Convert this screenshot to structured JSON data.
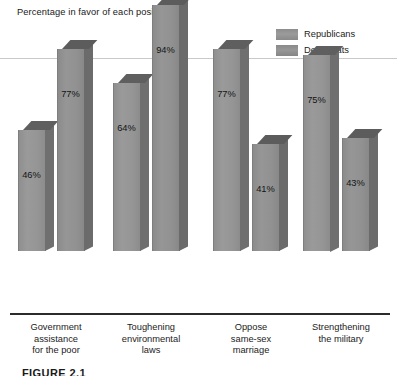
{
  "chart_data": {
    "type": "bar",
    "title": "Percentage in favor of each position",
    "xlabel": "",
    "ylabel": "",
    "ylim": [
      0,
      100
    ],
    "grid": false,
    "legend_position": "top-right",
    "categories": [
      "Government assistance for the poor",
      "Toughening environmental laws",
      "Oppose same-sex marriage",
      "Strengthening the military"
    ],
    "category_lines": [
      [
        "Government",
        "assistance",
        "for the poor"
      ],
      [
        "Toughening",
        "environmental",
        "laws"
      ],
      [
        "Oppose",
        "same-sex",
        "marriage"
      ],
      [
        "Strengthening",
        "the military"
      ]
    ],
    "series": [
      {
        "name": "Republicans",
        "color": "#959595",
        "values": [
          46,
          64,
          77,
          75
        ],
        "labels": [
          "46%",
          "64%",
          "77%",
          "75%"
        ]
      },
      {
        "name": "Democrats",
        "color": "#919191",
        "values": [
          77,
          94,
          41,
          43
        ],
        "labels": [
          "77%",
          "94%",
          "41%",
          "43%"
        ]
      }
    ]
  },
  "legend": {
    "items": [
      {
        "label": "Republicans",
        "swatch": "republicans-swatch"
      },
      {
        "label": "Democrats",
        "swatch": "democrats-swatch"
      }
    ]
  },
  "caption": {
    "text": "FIGURE 2.1"
  }
}
